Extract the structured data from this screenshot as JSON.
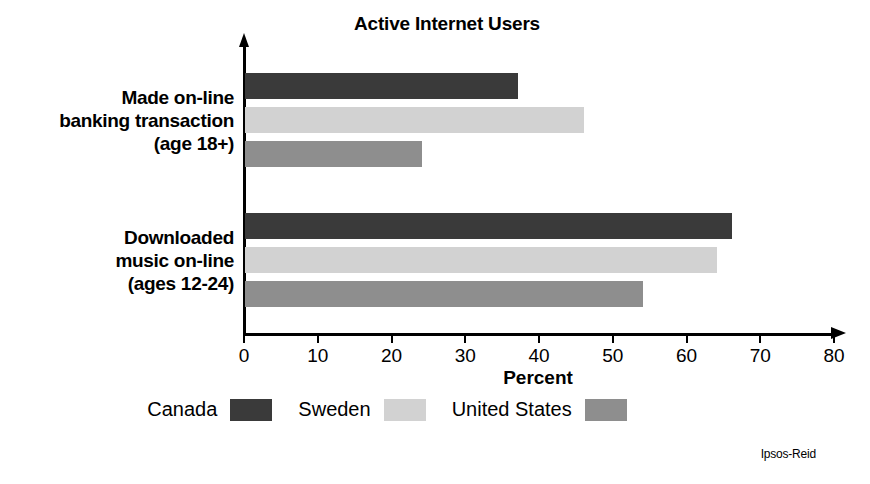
{
  "chart_data": {
    "type": "bar",
    "orientation": "horizontal",
    "title": "Active Internet Users",
    "xlabel": "Percent",
    "ylabel": "",
    "xlim": [
      0,
      80
    ],
    "xticks": [
      0,
      10,
      20,
      30,
      40,
      50,
      60,
      70,
      80
    ],
    "grid": false,
    "legend_position": "bottom",
    "categories": [
      "Made on-line banking transaction (age 18+)",
      "Downloaded music on-line (ages 12-24)"
    ],
    "series": [
      {
        "name": "Canada",
        "color": "#3a3a3a",
        "values": [
          37,
          66
        ]
      },
      {
        "name": "Sweden",
        "color": "#d2d2d2",
        "values": [
          46,
          64
        ]
      },
      {
        "name": "United States",
        "color": "#8e8e8e",
        "values": [
          24,
          54
        ]
      }
    ],
    "source": "Ipsos-Reid"
  },
  "category_label_lines": [
    [
      "Made on-line",
      "banking transaction",
      "(age 18+)"
    ],
    [
      "Downloaded",
      "music on-line",
      "(ages 12-24)"
    ]
  ],
  "credit": "Ipsos-Reid"
}
